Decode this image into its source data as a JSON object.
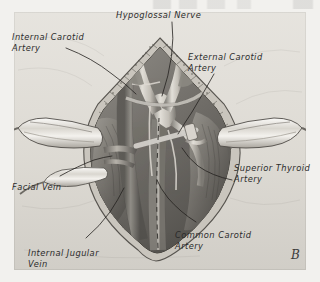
{
  "figure": {
    "marker": "B",
    "background_color": "#f2f1ee",
    "plate_color": "#e9e7e2",
    "ink_color": "#2b2b2b"
  },
  "labels": [
    {
      "id": "hypoglossal-nerve",
      "text": "Hypoglossal Nerve"
    },
    {
      "id": "internal-carotid-artery",
      "text": "Internal Carotid\nArtery"
    },
    {
      "id": "external-carotid-artery",
      "text": "External Carotid\nArtery"
    },
    {
      "id": "superior-thyroid-artery",
      "text": "Superior Thyroid\nArtery"
    },
    {
      "id": "facial-vein",
      "text": "Facial Vein"
    },
    {
      "id": "common-carotid-artery",
      "text": "Common Carotid\nArtery"
    },
    {
      "id": "internal-jugular-vein",
      "text": "Internal Jugular\nVein"
    }
  ]
}
